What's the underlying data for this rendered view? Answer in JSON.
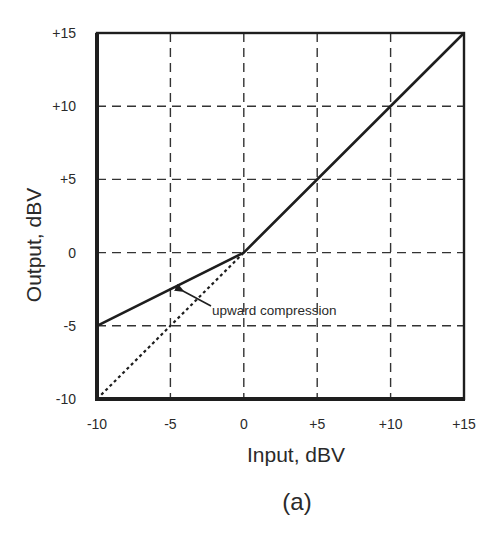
{
  "chart_data": {
    "type": "line",
    "title": "",
    "caption": "(a)",
    "xlabel": "Input, dBV",
    "ylabel": "Output, dBV",
    "xlim": [
      -10,
      15
    ],
    "ylim": [
      -10,
      15
    ],
    "grid": true,
    "grid_style": "dashed",
    "x_ticks": [
      -10,
      -5,
      0,
      5,
      10,
      15
    ],
    "y_ticks": [
      -10,
      -5,
      0,
      5,
      10,
      15
    ],
    "x_tick_labels": [
      "-10",
      "-5",
      "0",
      "+5",
      "+10",
      "+15"
    ],
    "y_tick_labels": [
      "-10",
      "-5",
      "0",
      "+5",
      "+10",
      "+15"
    ],
    "legend": null,
    "series": [
      {
        "name": "transfer curve (upward compression)",
        "style": "solid",
        "x": [
          -10,
          0,
          15
        ],
        "y": [
          -5,
          0,
          15
        ]
      },
      {
        "name": "unity (uncompressed) reference",
        "style": "dotted",
        "x": [
          -10,
          0
        ],
        "y": [
          -10,
          0
        ]
      }
    ],
    "annotations": [
      {
        "text": "upward compression",
        "arrow_to": {
          "x": -4,
          "y": -3
        }
      }
    ]
  },
  "colors": {
    "line": "#1e1e1e",
    "grid": "#333333",
    "text": "#2a2a2a",
    "background": "#ffffff"
  }
}
